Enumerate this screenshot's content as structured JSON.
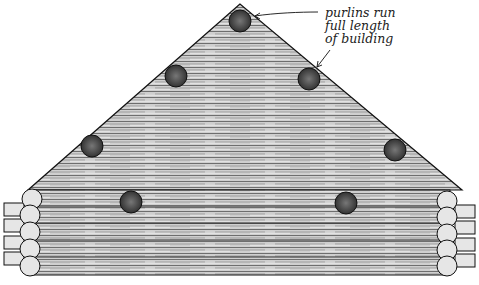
{
  "diagram": {
    "annotation": {
      "lines": [
        "purlins run",
        "full length",
        "of building"
      ]
    },
    "purlins": [
      {
        "x": 240,
        "y": 21
      },
      {
        "x": 176,
        "y": 76
      },
      {
        "x": 309,
        "y": 79
      },
      {
        "x": 92,
        "y": 146
      },
      {
        "x": 395,
        "y": 150
      },
      {
        "x": 131,
        "y": 202
      },
      {
        "x": 346,
        "y": 203
      }
    ],
    "colors": {
      "ink": "#1a1a1a",
      "wood": "#d8d8d8",
      "background": "#ffffff"
    }
  }
}
